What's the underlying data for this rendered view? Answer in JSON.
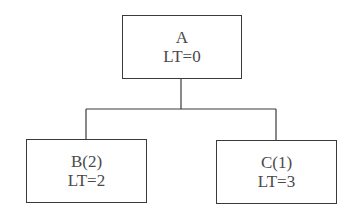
{
  "diagram": {
    "type": "tree",
    "nodes": [
      {
        "id": "A",
        "label": "A",
        "sublabel": "LT=0"
      },
      {
        "id": "B",
        "label": "B(2)",
        "sublabel": "LT=2"
      },
      {
        "id": "C",
        "label": "C(1)",
        "sublabel": "LT=3"
      }
    ],
    "edges": [
      {
        "from": "A",
        "to": "B"
      },
      {
        "from": "A",
        "to": "C"
      }
    ]
  }
}
